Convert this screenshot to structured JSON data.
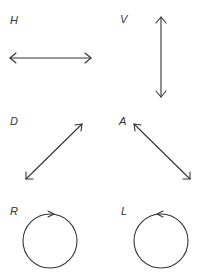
{
  "diagram": {
    "panels": [
      {
        "id": "H",
        "label": "H",
        "meaning": "horizontal",
        "shape": "double-arrow"
      },
      {
        "id": "V",
        "label": "V",
        "meaning": "vertical",
        "shape": "double-arrow"
      },
      {
        "id": "D",
        "label": "D",
        "meaning": "diagonal",
        "shape": "double-arrow"
      },
      {
        "id": "A",
        "label": "A",
        "meaning": "anti-diagonal",
        "shape": "double-arrow"
      },
      {
        "id": "R",
        "label": "R",
        "meaning": "right circular",
        "shape": "circle-arrow-clockwise"
      },
      {
        "id": "L",
        "label": "L",
        "meaning": "left circular",
        "shape": "circle-arrow-counterclockwise"
      }
    ],
    "stroke_color": "#333333",
    "background": "#ffffff"
  }
}
